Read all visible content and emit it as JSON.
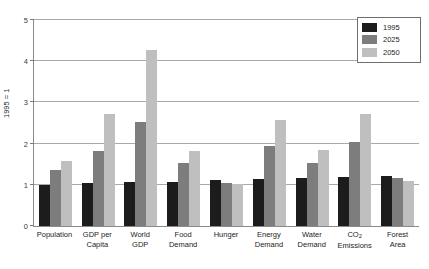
{
  "chart_data": {
    "type": "bar",
    "title": "",
    "xlabel": "",
    "ylabel": "1995 = 1",
    "ylim": [
      0,
      5
    ],
    "yticks": [
      0,
      1,
      2,
      3,
      4,
      5
    ],
    "ytick_labels": [
      "0",
      "1",
      "2",
      "3",
      "4",
      "5"
    ],
    "grid": true,
    "legend_position": "top-right",
    "categories": [
      "Population",
      "GDP per Capita",
      "World GDP",
      "Food Demand",
      "Hunger",
      "Energy Demand",
      "Water Demand",
      "CO2 Emissions",
      "Forest Area"
    ],
    "category_labels": [
      "Population",
      "GDP per\nCapita",
      "World\nGDP",
      "Food\nDemand",
      "Hunger",
      "Energy\nDemand",
      "Water\nDemand",
      "CO₂\nEmissions",
      "Forest\nArea"
    ],
    "series": [
      {
        "name": "1995",
        "color": "#1c1c1c",
        "values": [
          1.0,
          1.04,
          1.06,
          1.08,
          1.11,
          1.13,
          1.17,
          1.19,
          1.22
        ]
      },
      {
        "name": "2025",
        "color": "#7d7d7d",
        "values": [
          1.37,
          1.81,
          2.52,
          1.54,
          1.05,
          1.93,
          1.54,
          2.03,
          1.16
        ]
      },
      {
        "name": "2050",
        "color": "#bfbfbf",
        "values": [
          1.58,
          2.71,
          4.27,
          1.83,
          1.02,
          2.58,
          1.85,
          2.73,
          1.1
        ]
      }
    ]
  },
  "legend": {
    "items": [
      {
        "label": "1995",
        "color": "#1c1c1c"
      },
      {
        "label": "2025",
        "color": "#7d7d7d"
      },
      {
        "label": "2050",
        "color": "#bfbfbf"
      }
    ]
  },
  "axis": {
    "y_title": "1995 = 1"
  }
}
